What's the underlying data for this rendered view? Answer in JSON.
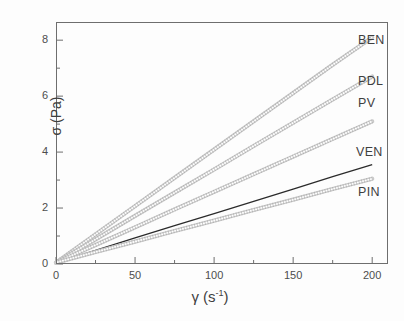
{
  "figure": {
    "kind": "scientific-plot",
    "background": "#ffffff",
    "frame_color": "#6e6e6e"
  },
  "axes": {
    "x": {
      "label_symbol": "γ",
      "label_unit_open": "(s",
      "label_unit_sup": "-1",
      "label_unit_close": ")",
      "label_full": "γ (s-1)",
      "min": 0,
      "max": 210,
      "major_ticks": [
        0,
        50,
        100,
        150,
        200
      ],
      "minor_ticks": [
        25,
        75,
        125,
        175
      ],
      "tick_labels": [
        "0",
        "50",
        "100",
        "150",
        "200"
      ]
    },
    "y": {
      "label_full": "σ (Pa)",
      "min": 0,
      "max": 8.65,
      "major_ticks": [
        0,
        2,
        4,
        6,
        8
      ],
      "minor_ticks": [
        1,
        3,
        5,
        7
      ],
      "tick_labels": [
        "0",
        "2",
        "4",
        "6",
        "8"
      ]
    }
  },
  "chart_data": {
    "type": "line",
    "title": "",
    "xlabel": "γ (s⁻¹)",
    "ylabel": "σ (Pa)",
    "xlim": [
      0,
      210
    ],
    "ylim": [
      0,
      8.65
    ],
    "grid": false,
    "legend_position": "inline-right-end-of-curve",
    "x": [
      0,
      25,
      50,
      75,
      100,
      125,
      150,
      175,
      200
    ],
    "series": [
      {
        "name": "BEN",
        "slope_pa_s": 0.0405,
        "color": "#9a9a9a",
        "style": "dense-open-circle-markers",
        "values": [
          0.05,
          1.06,
          2.07,
          3.08,
          4.09,
          5.1,
          6.11,
          7.12,
          8.1
        ]
      },
      {
        "name": "PDL",
        "slope_pa_s": 0.0333,
        "color": "#9a9a9a",
        "style": "dense-open-circle-markers",
        "values": [
          0.05,
          0.88,
          1.72,
          2.55,
          3.38,
          4.22,
          5.05,
          5.88,
          6.7
        ]
      },
      {
        "name": "PV",
        "slope_pa_s": 0.0253,
        "color": "#9a9a9a",
        "style": "dense-open-circle-markers",
        "values": [
          0.05,
          0.68,
          1.31,
          1.95,
          2.58,
          3.21,
          3.84,
          4.47,
          5.1
        ]
      },
      {
        "name": "VEN",
        "slope_pa_s": 0.0175,
        "color": "#2b2b2b",
        "style": "solid-line",
        "values": [
          0.05,
          0.49,
          0.93,
          1.37,
          1.8,
          2.24,
          2.68,
          3.12,
          3.55
        ]
      },
      {
        "name": "PIN",
        "slope_pa_s": 0.015,
        "color": "#9a9a9a",
        "style": "dense-open-circle-markers",
        "values": [
          0.05,
          0.43,
          0.8,
          1.18,
          1.55,
          1.93,
          2.3,
          2.68,
          3.05
        ]
      }
    ]
  },
  "series_labels": [
    {
      "text": "BEN",
      "left": 358,
      "top": 33
    },
    {
      "text": "PDL",
      "left": 358,
      "top": 74
    },
    {
      "text": "PV",
      "left": 358,
      "top": 96
    },
    {
      "text": "VEN",
      "left": 356,
      "top": 145
    },
    {
      "text": "PIN",
      "left": 358,
      "top": 185
    }
  ]
}
